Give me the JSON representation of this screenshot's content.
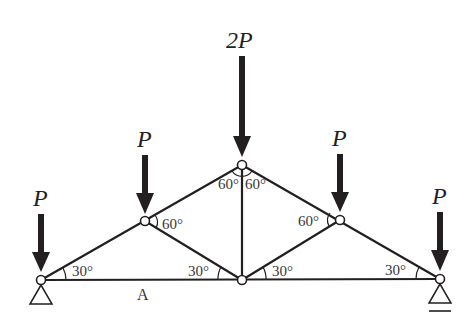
{
  "diagram": {
    "type": "truss",
    "loads": [
      {
        "label": "P",
        "node": "left-support"
      },
      {
        "label": "P",
        "node": "left-mid"
      },
      {
        "label": "2P",
        "node": "top"
      },
      {
        "label": "P",
        "node": "right-mid"
      },
      {
        "label": "P",
        "node": "right-support"
      }
    ],
    "angles": [
      {
        "label": "30°",
        "at": "left-support"
      },
      {
        "label": "60°",
        "at": "left-mid"
      },
      {
        "label": "60°",
        "at": "top-left"
      },
      {
        "label": "60°",
        "at": "top-right"
      },
      {
        "label": "60°",
        "at": "right-mid"
      },
      {
        "label": "30°",
        "at": "bottom-center-left"
      },
      {
        "label": "30°",
        "at": "bottom-center-right"
      },
      {
        "label": "30°",
        "at": "right-support"
      }
    ],
    "point_labels": [
      {
        "label": "A",
        "at": "bottom-chord-left"
      }
    ],
    "supports": [
      {
        "type": "pin",
        "node": "left-support"
      },
      {
        "type": "roller",
        "node": "right-support"
      }
    ],
    "colors": {
      "ink": "#231f20",
      "background": "#ffffff"
    }
  }
}
